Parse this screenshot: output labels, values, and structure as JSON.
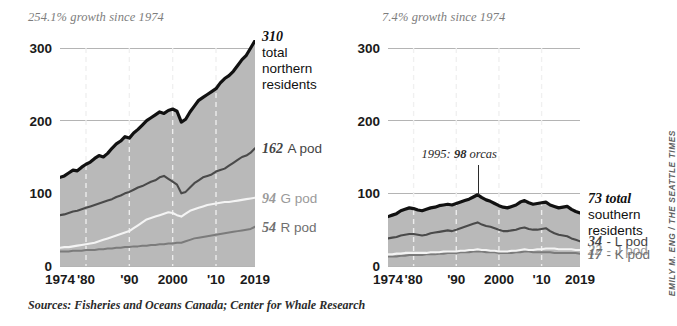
{
  "headers": {
    "left_growth": "254.1% growth since 1974",
    "right_growth": "7.4% growth since 1974"
  },
  "footer": {
    "sources": "Sources: Fisheries and Oceans Canada; Center for Whale Research",
    "credit": "EMILY M. ENG / THE SEATTLE TIMES"
  },
  "colors": {
    "total": "#111111",
    "series_dark": "#4a4a4a",
    "series_white": "#f4f4f4",
    "series_mid": "#7b7b7b",
    "area_fill": "#b9b9b9",
    "gridline": "#b4b4b4",
    "vertical_gridline": "#f0f0f0",
    "text": "#1a1a1a",
    "muted_text": "#7d7d7d"
  },
  "callouts": {
    "left": [
      {
        "value": "310",
        "name": "total",
        "name2": "northern",
        "name3": "residents",
        "tone": "c-black"
      },
      {
        "value": "162",
        "name": "A pod",
        "tone": "c-dark"
      },
      {
        "value": "94",
        "name": "G pod",
        "tone": "c-light"
      },
      {
        "value": "54",
        "name": "R pod",
        "tone": "c-mid"
      }
    ],
    "right": [
      {
        "value": "73 total",
        "name": "southern",
        "name2": "residents",
        "tone": "c-black"
      },
      {
        "value": "34",
        "name": "- L pod",
        "tone": "c-dark"
      },
      {
        "value": "22",
        "name": "- J pod",
        "tone": "c-light"
      },
      {
        "value": "17",
        "name": "- K pod",
        "tone": "c-mid"
      }
    ]
  },
  "annotation": {
    "peak_prefix": "1995:",
    "peak_value": "98",
    "peak_suffix": "orcas",
    "peak_year": 1995,
    "peak_count": 98
  },
  "chart_data": [
    {
      "type": "area",
      "id": "northern-residents",
      "title": "Northern resident killer whales",
      "subtitle": "254.1% growth since 1974",
      "xlabel": "",
      "ylabel": "",
      "xlim": [
        1974,
        2019
      ],
      "ylim": [
        0,
        310
      ],
      "yticks": [
        0,
        100,
        200,
        300
      ],
      "xticks": [
        1974,
        1980,
        1990,
        2000,
        2010,
        2019
      ],
      "xtick_labels": [
        "1974",
        "'80",
        "'90",
        "2000",
        "'10",
        "2019"
      ],
      "grid": "horizontal-and-dashed-vertical",
      "legend": "inline-right-labels",
      "x": [
        1974,
        1975,
        1976,
        1977,
        1978,
        1979,
        1980,
        1981,
        1982,
        1983,
        1984,
        1985,
        1986,
        1987,
        1988,
        1989,
        1990,
        1991,
        1992,
        1993,
        1994,
        1995,
        1996,
        1997,
        1998,
        1999,
        2000,
        2001,
        2002,
        2003,
        2004,
        2005,
        2006,
        2007,
        2008,
        2009,
        2010,
        2011,
        2012,
        2013,
        2014,
        2015,
        2016,
        2017,
        2018,
        2019
      ],
      "series": [
        {
          "name": "total northern residents",
          "color": "#111111",
          "end_value": 310,
          "values": [
            122,
            124,
            128,
            132,
            131,
            136,
            140,
            143,
            148,
            152,
            150,
            155,
            162,
            168,
            172,
            178,
            176,
            183,
            188,
            194,
            200,
            204,
            208,
            212,
            210,
            214,
            216,
            213,
            198,
            202,
            212,
            220,
            228,
            232,
            236,
            240,
            244,
            252,
            258,
            262,
            268,
            276,
            284,
            290,
            300,
            310
          ]
        },
        {
          "name": "A pod",
          "color": "#4a4a4a",
          "end_value": 162,
          "values": [
            70,
            71,
            73,
            75,
            76,
            78,
            80,
            82,
            84,
            86,
            88,
            90,
            92,
            95,
            97,
            100,
            102,
            105,
            108,
            110,
            113,
            116,
            118,
            122,
            124,
            120,
            116,
            112,
            100,
            102,
            108,
            114,
            118,
            122,
            124,
            126,
            130,
            132,
            134,
            138,
            142,
            146,
            150,
            152,
            156,
            162
          ]
        },
        {
          "name": "G pod",
          "color": "#f4f4f4",
          "end_value": 94,
          "values": [
            25,
            26,
            26,
            27,
            28,
            29,
            30,
            31,
            32,
            34,
            36,
            38,
            40,
            42,
            44,
            46,
            48,
            52,
            56,
            60,
            64,
            66,
            68,
            70,
            72,
            74,
            73,
            70,
            68,
            72,
            76,
            78,
            80,
            82,
            84,
            85,
            86,
            87,
            88,
            88,
            89,
            90,
            91,
            92,
            93,
            94
          ]
        },
        {
          "name": "R pod",
          "color": "#7b7b7b",
          "end_value": 54,
          "values": [
            20,
            20,
            20,
            21,
            21,
            21,
            22,
            22,
            22,
            23,
            23,
            24,
            24,
            25,
            25,
            26,
            26,
            27,
            27,
            28,
            28,
            29,
            29,
            30,
            30,
            31,
            31,
            32,
            32,
            34,
            36,
            38,
            39,
            40,
            41,
            42,
            43,
            44,
            45,
            46,
            47,
            48,
            49,
            50,
            51,
            54
          ]
        }
      ]
    },
    {
      "type": "area",
      "id": "southern-residents",
      "title": "Southern resident killer whales",
      "subtitle": "7.4% growth since 1974",
      "xlabel": "",
      "ylabel": "",
      "xlim": [
        1974,
        2019
      ],
      "ylim": [
        0,
        310
      ],
      "yticks": [
        0,
        100,
        200,
        300
      ],
      "xticks": [
        1974,
        1980,
        1990,
        2000,
        2010,
        2019
      ],
      "xtick_labels": [
        "1974",
        "'80",
        "'90",
        "2000",
        "'10",
        "2019"
      ],
      "grid": "horizontal-and-dashed-vertical",
      "legend": "inline-right-labels",
      "annotation": "1995: 98 orcas",
      "x": [
        1974,
        1975,
        1976,
        1977,
        1978,
        1979,
        1980,
        1981,
        1982,
        1983,
        1984,
        1985,
        1986,
        1987,
        1988,
        1989,
        1990,
        1991,
        1992,
        1993,
        1994,
        1995,
        1996,
        1997,
        1998,
        1999,
        2000,
        2001,
        2002,
        2003,
        2004,
        2005,
        2006,
        2007,
        2008,
        2009,
        2010,
        2011,
        2012,
        2013,
        2014,
        2015,
        2016,
        2017,
        2018,
        2019
      ],
      "series": [
        {
          "name": "total southern residents",
          "color": "#111111",
          "end_value": 73,
          "values": [
            68,
            70,
            72,
            76,
            78,
            80,
            79,
            77,
            76,
            78,
            80,
            81,
            83,
            84,
            85,
            84,
            86,
            88,
            90,
            92,
            95,
            98,
            94,
            91,
            89,
            86,
            83,
            81,
            80,
            82,
            84,
            88,
            90,
            87,
            85,
            86,
            87,
            88,
            84,
            82,
            80,
            81,
            82,
            78,
            75,
            73
          ]
        },
        {
          "name": "L pod",
          "color": "#4a4a4a",
          "end_value": 34,
          "values": [
            38,
            39,
            40,
            42,
            43,
            44,
            44,
            43,
            42,
            43,
            45,
            46,
            47,
            48,
            49,
            48,
            50,
            52,
            54,
            56,
            58,
            60,
            57,
            55,
            54,
            52,
            50,
            48,
            48,
            49,
            50,
            52,
            53,
            51,
            50,
            50,
            51,
            52,
            48,
            45,
            43,
            42,
            41,
            38,
            36,
            34
          ]
        },
        {
          "name": "J pod",
          "color": "#f4f4f4",
          "end_value": 22,
          "values": [
            16,
            16,
            17,
            17,
            18,
            18,
            18,
            18,
            18,
            18,
            19,
            19,
            19,
            20,
            20,
            20,
            20,
            21,
            21,
            22,
            22,
            23,
            22,
            22,
            21,
            21,
            20,
            20,
            20,
            21,
            21,
            22,
            23,
            22,
            22,
            23,
            23,
            24,
            24,
            24,
            23,
            23,
            23,
            23,
            22,
            22
          ]
        },
        {
          "name": "K pod",
          "color": "#7b7b7b",
          "end_value": 17,
          "values": [
            13,
            13,
            13,
            14,
            14,
            15,
            15,
            15,
            15,
            16,
            16,
            16,
            17,
            17,
            18,
            18,
            18,
            19,
            19,
            19,
            20,
            20,
            20,
            19,
            19,
            19,
            18,
            18,
            18,
            18,
            19,
            19,
            20,
            20,
            19,
            19,
            19,
            19,
            19,
            18,
            18,
            18,
            18,
            18,
            18,
            17
          ]
        }
      ]
    }
  ]
}
